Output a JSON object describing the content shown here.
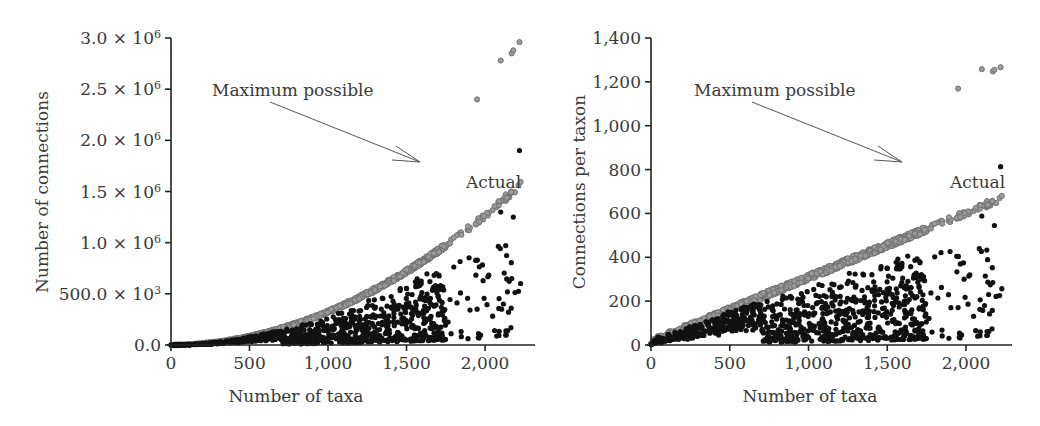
{
  "chart_data": [
    {
      "type": "scatter",
      "title": "",
      "xlabel": "Number of taxa",
      "ylabel": "Number of connections",
      "xlim": [
        0,
        2300
      ],
      "ylim": [
        0,
        3000000
      ],
      "x_ticks": [
        0,
        500,
        1000,
        1500,
        2000
      ],
      "x_tick_labels": [
        "0",
        "500",
        "1,000",
        "1,500",
        "2,000"
      ],
      "y_ticks": [
        0,
        500000,
        1000000,
        1500000,
        2000000,
        2500000,
        3000000
      ],
      "y_tick_labels": [
        "0.0",
        "500.0 × 10³",
        "1.0 × 10⁶",
        "1.5 × 10⁶",
        "2.0 × 10⁶",
        "2.5 × 10⁶",
        "3.0 × 10⁶"
      ],
      "grid": false,
      "series": [
        {
          "name": "Maximum possible",
          "color": "#7a7a7a",
          "marker": "open-circle-gray",
          "relation": "y = x(x-1)/2 approx (~ x^2 * 0.6)",
          "x_range": [
            0,
            2220
          ],
          "y_at_x": [
            [
              500,
              150000
            ],
            [
              1000,
              500000
            ],
            [
              1500,
              1200000
            ],
            [
              1650,
              1700000
            ],
            [
              2000,
              2400000
            ],
            [
              2220,
              2950000
            ]
          ]
        },
        {
          "name": "Actual",
          "color": "#111111",
          "marker": "filled-circle-black",
          "x_range": [
            0,
            2220
          ],
          "y_max_approx": 1900000,
          "notable_points": [
            [
              2220,
              1900000
            ],
            [
              2170,
              650000
            ],
            [
              1950,
              350000
            ]
          ]
        }
      ],
      "annotations": [
        {
          "text": "Maximum possible",
          "x": 300,
          "y": 2500000,
          "arrow_to": [
            1620,
            1780000
          ]
        },
        {
          "text": "Actual",
          "x": 1950,
          "y": 1550000
        }
      ]
    },
    {
      "type": "scatter",
      "title": "",
      "xlabel": "Number of taxa",
      "ylabel": "Connections per taxon",
      "xlim": [
        0,
        2300
      ],
      "ylim": [
        0,
        1400
      ],
      "x_ticks": [
        0,
        500,
        1000,
        1500,
        2000
      ],
      "x_tick_labels": [
        "0",
        "500",
        "1,000",
        "1,500",
        "2,000"
      ],
      "y_ticks": [
        0,
        200,
        400,
        600,
        800,
        1000,
        1200,
        1400
      ],
      "y_tick_labels": [
        "0",
        "200",
        "400",
        "600",
        "800",
        "1,000",
        "1,200",
        "1,400"
      ],
      "grid": false,
      "series": [
        {
          "name": "Maximum possible",
          "color": "#7a7a7a",
          "marker": "open-circle-gray",
          "x_range": [
            0,
            2220
          ],
          "y_at_x": [
            [
              500,
              70
            ],
            [
              1000,
              235
            ],
            [
              1500,
              560
            ],
            [
              1650,
              800
            ],
            [
              2000,
              1120
            ],
            [
              2220,
              1390
            ]
          ]
        },
        {
          "name": "Actual",
          "color": "#111111",
          "marker": "filled-circle-black",
          "x_range": [
            0,
            2220
          ],
          "y_max_approx": 890,
          "notable_points": [
            [
              2220,
              890
            ],
            [
              2170,
              300
            ],
            [
              1950,
              160
            ]
          ]
        }
      ],
      "annotations": [
        {
          "text": "Maximum possible",
          "x": 300,
          "y": 1170,
          "arrow_to": [
            1620,
            830
          ]
        },
        {
          "text": "Actual",
          "x": 1950,
          "y": 720
        }
      ]
    }
  ],
  "render": {
    "panels": [
      {
        "id": "left",
        "origin_x": 171,
        "origin_y": 345,
        "x_scale": 0.157,
        "y_top_px": 38,
        "y_max": 3000000,
        "axis_end_x": 535,
        "ytick_labels_html": [
          "0.0",
          "500.0 × 10<tspan baseline-shift='super' font-size='11'>3</tspan>",
          "1.0 × 10<tspan baseline-shift='super' font-size='11'>6</tspan>",
          "1.5 × 10<tspan baseline-shift='super' font-size='11'>6</tspan>",
          "2.0 × 10<tspan baseline-shift='super' font-size='11'>6</tspan>",
          "2.5 × 10<tspan baseline-shift='super' font-size='11'>6</tspan>",
          "3.0 × 10<tspan baseline-shift='super' font-size='11'>6</tspan>"
        ],
        "ylabel_x": 48
      },
      {
        "id": "right",
        "origin_x": 651,
        "origin_y": 345,
        "x_scale": 0.1575,
        "y_top_px": 38,
        "y_max": 1400,
        "axis_end_x": 1012,
        "ytick_labels_html": [
          "0",
          "200",
          "400",
          "600",
          "800",
          "1,000",
          "1,200",
          "1,400"
        ],
        "ylabel_x": 585
      }
    ],
    "colors": {
      "axis": "#222222",
      "max_fill": "#9a9a9a",
      "max_stroke": "#6e6e6e",
      "actual": "#111111",
      "text": "#3a3a3a",
      "arrow": "#555555"
    }
  }
}
